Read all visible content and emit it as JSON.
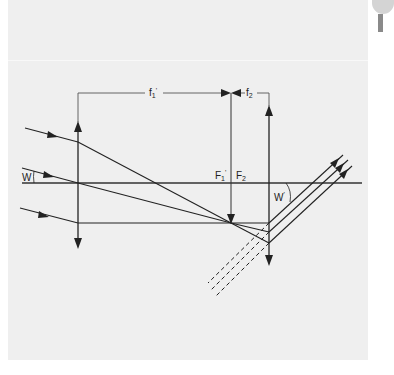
{
  "diagram": {
    "type": "optical-ray-diagram",
    "colors": {
      "background": "#efefef",
      "line": "#222222"
    },
    "labels": {
      "f1": {
        "main": "f",
        "sub": "1",
        "sup": "'"
      },
      "f2": {
        "main": "f",
        "sub": "2"
      },
      "F1": {
        "main": "F",
        "sub": "1",
        "sup": "'"
      },
      "F2": {
        "main": "F",
        "sub": "2"
      },
      "W_in": {
        "main": "W"
      },
      "W_out": {
        "main": "W",
        "sup": "'"
      }
    },
    "elements": [
      "optical-axis",
      "lens-1 (converging, left)",
      "lens-2 (converging, right)",
      "focal-length-bracket f1'",
      "focal-length-bracket f2",
      "three incoming parallel rays",
      "three outgoing parallel rays",
      "three dashed virtual ray extensions"
    ]
  }
}
